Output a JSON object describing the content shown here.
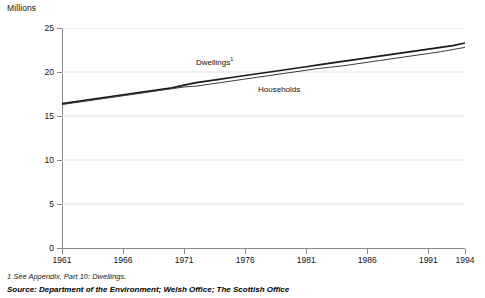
{
  "chart_data": {
    "type": "line",
    "title": "",
    "ylabel": "Millions",
    "xlabel": "",
    "ylim": [
      0,
      25
    ],
    "xlim": [
      1961,
      1994
    ],
    "grid": true,
    "legend_position": "inline-annotation",
    "yticks": [
      0,
      5,
      10,
      15,
      20,
      25
    ],
    "ytick_labels": [
      "0",
      "5",
      "10",
      "15",
      "20",
      "25"
    ],
    "xticks": [
      1961,
      1966,
      1971,
      1976,
      1981,
      1986,
      1991,
      1994
    ],
    "xtick_labels": [
      "1961",
      "1966",
      "1971",
      "1976",
      "1981",
      "1986",
      "1991",
      "1994"
    ],
    "x": [
      1961,
      1962,
      1963,
      1964,
      1965,
      1966,
      1967,
      1968,
      1969,
      1970,
      1971,
      1972,
      1973,
      1974,
      1975,
      1976,
      1977,
      1978,
      1979,
      1980,
      1981,
      1982,
      1983,
      1984,
      1985,
      1986,
      1987,
      1988,
      1989,
      1990,
      1991,
      1992,
      1993,
      1994
    ],
    "series": [
      {
        "name": "Dwellings",
        "label": "Dwellings",
        "footnote_marker": "1",
        "color": "#1a1a1a",
        "width": 1.7,
        "values": [
          16.4,
          16.6,
          16.8,
          17.0,
          17.2,
          17.4,
          17.6,
          17.8,
          18.0,
          18.2,
          18.5,
          18.8,
          19.0,
          19.2,
          19.4,
          19.6,
          19.8,
          20.0,
          20.2,
          20.4,
          20.6,
          20.8,
          21.0,
          21.2,
          21.4,
          21.6,
          21.8,
          22.0,
          22.2,
          22.4,
          22.6,
          22.8,
          23.0,
          23.3
        ]
      },
      {
        "name": "Households",
        "label": "Households",
        "color": "#3a3a3a",
        "width": 1.0,
        "values": [
          16.3,
          16.5,
          16.7,
          16.9,
          17.1,
          17.3,
          17.5,
          17.7,
          17.9,
          18.1,
          18.3,
          18.4,
          18.6,
          18.8,
          19.0,
          19.2,
          19.4,
          19.6,
          19.8,
          20.0,
          20.2,
          20.4,
          20.55,
          20.7,
          20.9,
          21.1,
          21.3,
          21.5,
          21.7,
          21.9,
          22.1,
          22.3,
          22.55,
          22.8
        ]
      }
    ],
    "annotations": [
      {
        "text": "Dwellings",
        "marker": "1",
        "x_px": 196,
        "y_px": 57
      },
      {
        "text": "Households",
        "marker": "",
        "x_px": 258,
        "y_px": 86
      }
    ]
  },
  "footer": {
    "footnote": "1  See Appendix, Part 10: Dwellings.",
    "source": "Source: Department of the Environment; Welsh Office; The Scottish Office"
  },
  "colors": {
    "axis": "#8a8a8a",
    "grid": "#e2e2e2",
    "dwellings": "#1a1a1a",
    "households": "#3a3a3a",
    "text": "#111111"
  }
}
